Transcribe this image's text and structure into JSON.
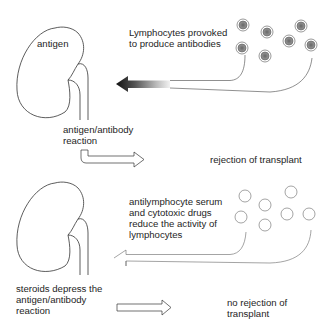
{
  "top_panel": {
    "kidney_label": "antigen",
    "lymphocytes_label": [
      "Lymphocytes provoked",
      "to produce antibodies"
    ],
    "reaction_label": [
      "antigen/antibody",
      "reaction"
    ],
    "outcome_label": "rejection of transplant"
  },
  "bottom_panel": {
    "treatment_label": [
      "antilymphocyte serum",
      "and cytotoxic drugs",
      "reduce the activity of",
      "lymphocytes"
    ],
    "steroids_label": [
      "steroids depress the",
      "antigen/antibody",
      "reaction"
    ],
    "outcome_label": [
      "no rejection of",
      "transplant"
    ]
  },
  "colors": {
    "line": "#333333",
    "cell_fill_active": "#8a8a8a",
    "arrow_dark": "#1a1a1a"
  }
}
